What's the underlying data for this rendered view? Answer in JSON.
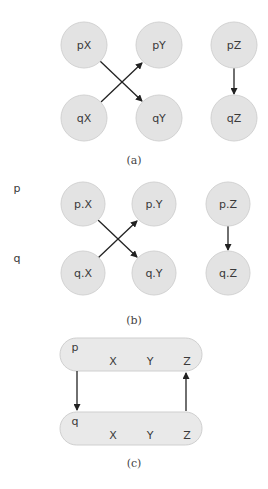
{
  "panels": {
    "a": {
      "caption": "(a)",
      "nodes": [
        {
          "id": "pX",
          "label": "pX",
          "x": 84,
          "y": 45
        },
        {
          "id": "pY",
          "label": "pY",
          "x": 159,
          "y": 45
        },
        {
          "id": "pZ",
          "label": "pZ",
          "x": 234,
          "y": 45
        },
        {
          "id": "qX",
          "label": "qX",
          "x": 84,
          "y": 118
        },
        {
          "id": "qY",
          "label": "qY",
          "x": 159,
          "y": 118
        },
        {
          "id": "qZ",
          "label": "qZ",
          "x": 234,
          "y": 118
        }
      ],
      "edges": [
        {
          "from": "pX",
          "to": "qY"
        },
        {
          "from": "qX",
          "to": "pY"
        },
        {
          "from": "pZ",
          "to": "qZ"
        }
      ]
    },
    "b": {
      "caption": "(b)",
      "row_labels": {
        "p": "p",
        "q": "q"
      },
      "nodes": [
        {
          "id": "p.X",
          "label": "p.X",
          "x": 83,
          "y": 204
        },
        {
          "id": "p.Y",
          "label": "p.Y",
          "x": 154,
          "y": 204
        },
        {
          "id": "p.Z",
          "label": "p.Z",
          "x": 228,
          "y": 204
        },
        {
          "id": "q.X",
          "label": "q.X",
          "x": 83,
          "y": 273
        },
        {
          "id": "q.Y",
          "label": "q.Y",
          "x": 154,
          "y": 273
        },
        {
          "id": "q.Z",
          "label": "q.Z",
          "x": 228,
          "y": 273
        }
      ],
      "edges": [
        {
          "from": "p.X",
          "to": "q.Y"
        },
        {
          "from": "q.X",
          "to": "p.Y"
        },
        {
          "from": "p.Z",
          "to": "q.Z"
        }
      ]
    },
    "c": {
      "caption": "(c)",
      "groups": [
        {
          "name": "p",
          "fields": [
            "X",
            "Y",
            "Z"
          ]
        },
        {
          "name": "q",
          "fields": [
            "X",
            "Y",
            "Z"
          ]
        }
      ],
      "edges": [
        {
          "from": "p",
          "to": "q",
          "side": "left"
        },
        {
          "from": "q.Z",
          "to": "p.Z",
          "side": "right"
        }
      ]
    }
  }
}
